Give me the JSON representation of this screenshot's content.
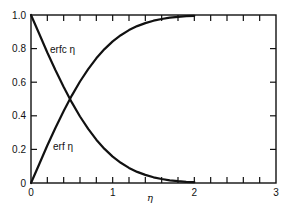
{
  "chart_data": {
    "type": "line",
    "title": "",
    "xlabel": "η",
    "ylabel": "",
    "xlim": [
      0,
      3
    ],
    "ylim": [
      0,
      1.0
    ],
    "grid": false,
    "legend": "inline labels",
    "x_ticks": [
      "0",
      "1",
      "2",
      "3"
    ],
    "y_ticks": [
      "0",
      "0.2",
      "0.4",
      "0.6",
      "0.8",
      "1.0"
    ],
    "x_minor_step": 0.2,
    "series": [
      {
        "name": "erf η",
        "label": "erf η",
        "x": [
          0,
          0.1,
          0.2,
          0.3,
          0.4,
          0.5,
          0.6,
          0.7,
          0.8,
          0.9,
          1.0,
          1.1,
          1.2,
          1.3,
          1.4,
          1.5,
          1.6,
          1.7,
          1.8,
          1.9,
          2.0
        ],
        "values": [
          0,
          0.112,
          0.223,
          0.329,
          0.428,
          0.52,
          0.604,
          0.678,
          0.742,
          0.797,
          0.843,
          0.88,
          0.91,
          0.934,
          0.952,
          0.966,
          0.976,
          0.984,
          0.989,
          0.993,
          0.995
        ]
      },
      {
        "name": "erfc η",
        "label": "erfc η",
        "x": [
          0,
          0.1,
          0.2,
          0.3,
          0.4,
          0.5,
          0.6,
          0.7,
          0.8,
          0.9,
          1.0,
          1.1,
          1.2,
          1.3,
          1.4,
          1.5,
          1.6,
          1.7,
          1.8,
          1.9,
          2.0
        ],
        "values": [
          1.0,
          0.888,
          0.777,
          0.671,
          0.572,
          0.48,
          0.396,
          0.322,
          0.258,
          0.203,
          0.157,
          0.12,
          0.09,
          0.066,
          0.048,
          0.034,
          0.024,
          0.016,
          0.011,
          0.007,
          0.005
        ]
      }
    ],
    "annotations": [
      {
        "text": "erfc η",
        "x": 0.24,
        "y": 0.78
      },
      {
        "text": "erf η",
        "x": 0.28,
        "y": 0.2
      }
    ]
  },
  "layout": {
    "plot": {
      "left": 31,
      "top": 15,
      "right": 276,
      "bottom": 183
    },
    "line_color": "#111111"
  }
}
